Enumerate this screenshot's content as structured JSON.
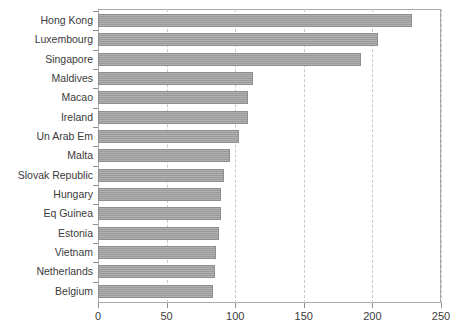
{
  "chart_data": {
    "type": "bar",
    "orientation": "horizontal",
    "title": "",
    "subtitle": "",
    "xlabel": "",
    "ylabel": "",
    "xlim": [
      0,
      250
    ],
    "xticks": [
      0,
      50,
      100,
      150,
      200,
      250
    ],
    "xtick_labels": [
      "0",
      "50",
      "100",
      "150",
      "200",
      "250"
    ],
    "grid": "vertical-dashed",
    "legend": null,
    "bar_color": "#9a9a9a",
    "bar_edge_color": "#8e8e8e",
    "axis_color": "#a9a9a9",
    "gridline_color": "#c9c9c9",
    "categories": [
      "Hong Kong",
      "Luxembourg",
      "Singapore",
      "Maldives",
      "Macao",
      "Ireland",
      "Un Arab Em",
      "Malta",
      "Slovak Republic",
      "Hungary",
      "Eq Guinea",
      "Estonia",
      "Vietnam",
      "Netherlands",
      "Belgium"
    ],
    "values": [
      229,
      204,
      192,
      113,
      109,
      109,
      103,
      96,
      92,
      90,
      90,
      88,
      86,
      85,
      84
    ]
  }
}
